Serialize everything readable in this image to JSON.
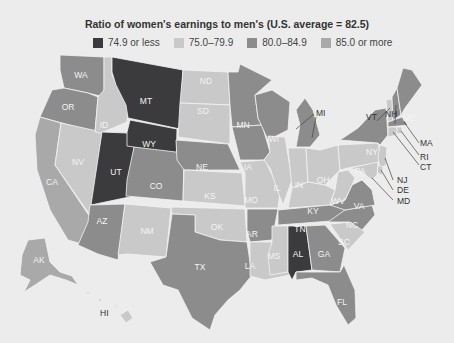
{
  "title": "Ratio of women's earnings to men's (U.S. average = 82.5)",
  "colors": {
    "c1": "#3b3b3d",
    "c2": "#c9c9c9",
    "c3": "#8c8c8c",
    "c4": "#a9a9a9"
  },
  "legend": [
    {
      "label": "74.9 or less",
      "class": "c1"
    },
    {
      "label": "75.0–79.9",
      "class": "c2"
    },
    {
      "label": "80.0–84.9",
      "class": "c3"
    },
    {
      "label": "85.0 or more",
      "class": "c4"
    }
  ],
  "states": {
    "WA": "c3",
    "OR": "c3",
    "CA": "c4",
    "NV": "c2",
    "ID": "c2",
    "MT": "c1",
    "WY": "c1",
    "UT": "c1",
    "CO": "c3",
    "AZ": "c3",
    "NM": "c2",
    "ND": "c2",
    "SD": "c2",
    "NE": "c3",
    "KS": "c2",
    "OK": "c2",
    "TX": "c3",
    "MN": "c3",
    "IA": "c3",
    "MO": "c2",
    "AR": "c3",
    "LA": "c2",
    "WI": "c3",
    "IL": "c2",
    "MI": "c3",
    "IN": "c2",
    "OH": "c2",
    "KY": "c2",
    "TN": "c3",
    "MS": "c2",
    "AL": "c1",
    "GA": "c3",
    "FL": "c3",
    "SC": "c2",
    "NC": "c3",
    "VA": "c3",
    "WV": "c2",
    "PA": "c2",
    "NY": "c3",
    "VT": "c2",
    "NH": "c3",
    "ME": "c3",
    "MA": "c3",
    "RI": "c2",
    "CT": "c2",
    "NJ": "c2",
    "DE": "c2",
    "MD": "c2",
    "AK": "c4",
    "HI": "c2"
  },
  "labels": {
    "WA": "WA",
    "OR": "OR",
    "CA": "CA",
    "NV": "NV",
    "ID": "ID",
    "MT": "MT",
    "WY": "WY",
    "UT": "UT",
    "CO": "CO",
    "AZ": "AZ",
    "NM": "NM",
    "ND": "ND",
    "SD": "SD",
    "NE": "NE",
    "KS": "KS",
    "OK": "OK",
    "TX": "TX",
    "MN": "MN",
    "IA": "IA",
    "MO": "MO",
    "AR": "AR",
    "LA": "LA",
    "WI": "WI",
    "IL": "IL",
    "MI": "MI",
    "IN": "IN",
    "OH": "OH",
    "KY": "KY",
    "TN": "TN",
    "MS": "MS",
    "AL": "AL",
    "GA": "GA",
    "FL": "FL",
    "SC": "SC",
    "NC": "NC",
    "VA": "VA",
    "WV": "WV",
    "PA": "PA",
    "NY": "NY",
    "VT": "VT",
    "NH": "NH",
    "ME": "ME",
    "MA": "MA",
    "RI": "RI",
    "CT": "CT",
    "NJ": "NJ",
    "DE": "DE",
    "MD": "MD",
    "AK": "AK",
    "HI": "HI"
  }
}
